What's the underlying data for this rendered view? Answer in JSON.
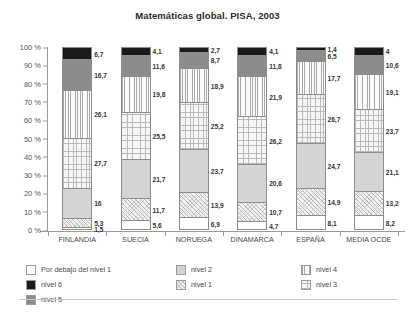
{
  "chart_data": {
    "type": "bar",
    "subtype": "stacked-bar-100-percent",
    "title": "Matemáticas global. PISA, 2003",
    "xlabel": "",
    "ylabel": "",
    "ylim": [
      0,
      100
    ],
    "y_ticks": [
      "0 %",
      "10 %",
      "20 %",
      "30 %",
      "40 %",
      "50 %",
      "60 %",
      "70 %",
      "80 %",
      "90 %",
      "100 %"
    ],
    "y_tick_values": [
      0,
      10,
      20,
      30,
      40,
      50,
      60,
      70,
      80,
      90,
      100
    ],
    "grid": false,
    "legend_position": "bottom",
    "categories": [
      "FINLANDIA",
      "SUECIA",
      "NORUEGA",
      "DINAMARCA",
      "ESPAÑA",
      "MEDIA OCDE"
    ],
    "series": [
      {
        "name": "Por debajo del nivel 1",
        "pattern": "blank-white",
        "values": [
          1.5,
          5.6,
          6.9,
          4.7,
          8.1,
          8.2
        ]
      },
      {
        "name": "nivel 1",
        "pattern": "diagonal-crosshatch",
        "values": [
          5.3,
          11.7,
          13.9,
          10.7,
          14.9,
          13.2
        ]
      },
      {
        "name": "nivel 2",
        "pattern": "solid-light-gray",
        "values": [
          16,
          21.7,
          23.7,
          20.6,
          24.7,
          21.1
        ]
      },
      {
        "name": "nivel 3",
        "pattern": "fine-grid",
        "values": [
          27.7,
          25.5,
          25.2,
          26.2,
          26.7,
          23.7
        ]
      },
      {
        "name": "nivel 4",
        "pattern": "vertical-lines",
        "values": [
          26.1,
          19.8,
          18.9,
          21.9,
          17.7,
          19.1
        ]
      },
      {
        "name": "nivel 5",
        "pattern": "solid-mid-gray",
        "values": [
          16.7,
          11.6,
          8.7,
          11.8,
          6.5,
          10.6
        ]
      },
      {
        "name": "nivel 6",
        "pattern": "solid-black",
        "values": [
          6.7,
          4.1,
          2.7,
          4.1,
          1.4,
          4
        ]
      }
    ],
    "value_labels": {
      "FINLANDIA": [
        "1,5",
        "5,3",
        "16",
        "27,7",
        "26,1",
        "16,7",
        "6,7"
      ],
      "SUECIA": [
        "5,6",
        "11,7",
        "21,7",
        "25,5",
        "19,8",
        "11,6",
        "4,1"
      ],
      "NORUEGA": [
        "6,9",
        "13,9",
        "23,7",
        "25,2",
        "18,9",
        "8,7",
        "2,7"
      ],
      "DINAMARCA": [
        "4,7",
        "10,7",
        "20,6",
        "26,2",
        "21,9",
        "11,8",
        "4,1"
      ],
      "ESPAÑA": [
        "8,1",
        "14,9",
        "24,7",
        "26,7",
        "17,7",
        "6,5",
        "1,4"
      ],
      "MEDIA OCDE": [
        "8,2",
        "13,2",
        "21,1",
        "23,7",
        "19,1",
        "10,6",
        "4"
      ]
    },
    "colors": {
      "below_level_1": "#ffffff",
      "nivel_1": "#f2f2f2",
      "nivel_2": "#d4d4d4",
      "nivel_3": "#f6f6f6",
      "nivel_4": "#fbfbfb",
      "nivel_5": "#8c8c8c",
      "nivel_6": "#1a1a1a",
      "axis": "#9a9a9a",
      "text": "#3a3a3a"
    }
  },
  "legend": {
    "items": [
      {
        "label": "Por debajo del nivel 1"
      },
      {
        "label": "nivel 1"
      },
      {
        "label": "nivel 2"
      },
      {
        "label": "nivel 3"
      },
      {
        "label": "nivel 4"
      },
      {
        "label": "nivel 5"
      },
      {
        "label": "nivel 6"
      }
    ]
  }
}
